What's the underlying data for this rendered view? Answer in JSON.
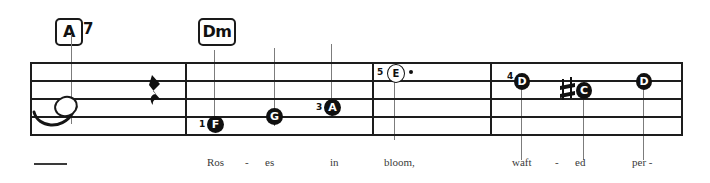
{
  "score": {
    "staff": {
      "left": 30,
      "right": 683,
      "top": 62,
      "bottom": 134,
      "line_count": 5,
      "line_spacing": 18
    },
    "barlines": [
      185,
      372,
      490
    ],
    "end_barline": 683,
    "chords": [
      {
        "name": "chord-a7",
        "root": "A",
        "extension": "7",
        "x": 55,
        "y": 18
      },
      {
        "name": "chord-dm",
        "root": "Dm",
        "extension": "",
        "x": 198,
        "y": 18
      }
    ],
    "notes": [
      {
        "name": "note-open-tied",
        "letter": "",
        "style": "blank-open",
        "finger": "",
        "x": 62,
        "y": 106,
        "dotted": false,
        "accidental": "",
        "guide": false
      },
      {
        "name": "note-f",
        "letter": "F",
        "style": "filled",
        "finger": "1",
        "x": 214,
        "y": 124,
        "dotted": false,
        "accidental": "",
        "guide": true
      },
      {
        "name": "note-g",
        "letter": "G",
        "style": "filled",
        "finger": "",
        "x": 274,
        "y": 116,
        "dotted": false,
        "accidental": "",
        "guide": true
      },
      {
        "name": "note-a",
        "letter": "A",
        "style": "filled",
        "finger": "3",
        "x": 331,
        "y": 107,
        "dotted": false,
        "accidental": "",
        "guide": true
      },
      {
        "name": "note-e",
        "letter": "E",
        "style": "open",
        "finger": "5",
        "x": 394,
        "y": 73,
        "dotted": true,
        "accidental": "",
        "guide": false
      },
      {
        "name": "note-d-first",
        "letter": "D",
        "style": "filled",
        "finger": "4",
        "x": 521,
        "y": 82,
        "dotted": false,
        "accidental": "",
        "guide": true
      },
      {
        "name": "note-c-sharp",
        "letter": "C",
        "style": "filled",
        "finger": "",
        "x": 583,
        "y": 90,
        "dotted": false,
        "accidental": "sharp",
        "guide": true
      },
      {
        "name": "note-d-last",
        "letter": "D",
        "style": "filled",
        "finger": "",
        "x": 643,
        "y": 82,
        "dotted": false,
        "accidental": "",
        "guide": true
      }
    ],
    "rest": {
      "name": "quarter-rest",
      "type": "quarter-rest",
      "x": 150,
      "y": 78
    },
    "slur": {
      "name": "tie-slur",
      "x": 36,
      "y": 112
    },
    "lead_dash": {
      "name": "lyric-lead-dash",
      "x": 34,
      "y": 163,
      "width": 33
    },
    "guides": [
      {
        "name": "chord-guide-a7",
        "x": 71,
        "y": 34,
        "height": 90
      },
      {
        "name": "chord-guide-dm",
        "x": 214,
        "y": 50,
        "height": 80
      },
      {
        "name": "beat-guide-g",
        "x": 274,
        "y": 48,
        "height": 78
      },
      {
        "name": "beat-guide-a",
        "x": 331,
        "y": 44,
        "height": 72
      },
      {
        "name": "beat-guide-e",
        "x": 394,
        "y": 78,
        "height": 60
      },
      {
        "name": "beat-guide-d1",
        "x": 521,
        "y": 86,
        "height": 74
      },
      {
        "name": "beat-guide-c",
        "x": 583,
        "y": 94,
        "height": 70
      },
      {
        "name": "beat-guide-d2",
        "x": 643,
        "y": 86,
        "height": 74
      }
    ],
    "lyrics": [
      {
        "name": "lyric-ros",
        "text": "Ros",
        "x": 207,
        "y": 159
      },
      {
        "name": "lyric-dash-1",
        "text": "-",
        "x": 243,
        "y": 159
      },
      {
        "name": "lyric-es",
        "text": "es",
        "x": 264,
        "y": 159
      },
      {
        "name": "lyric-in",
        "text": "in",
        "x": 329,
        "y": 159
      },
      {
        "name": "lyric-bloom",
        "text": "bloom,",
        "x": 385,
        "y": 159
      },
      {
        "name": "lyric-waft",
        "text": "waft",
        "x": 512,
        "y": 159
      },
      {
        "name": "lyric-dash-2",
        "text": "-",
        "x": 553,
        "y": 159
      },
      {
        "name": "lyric-ed",
        "text": "ed",
        "x": 575,
        "y": 159
      },
      {
        "name": "lyric-per",
        "text": "per -",
        "x": 632,
        "y": 159
      }
    ]
  },
  "colors": {
    "ink": "#1a1a1a",
    "guide": "#7c7c7c",
    "lyric": "#3a3a3a",
    "paper": "#ffffff"
  }
}
